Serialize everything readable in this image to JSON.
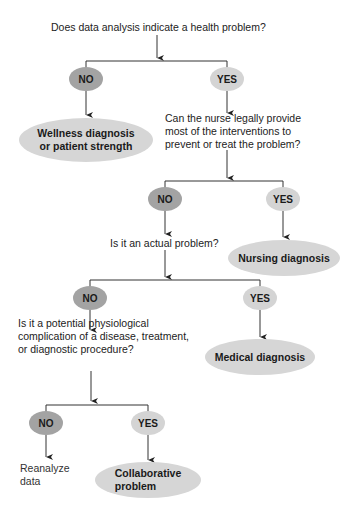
{
  "diagram": {
    "type": "decision-flowchart",
    "colors": {
      "no_oval": "#a3a3a3",
      "yes_oval": "#d4d4d4",
      "outcome_oval": "#d6d6d6",
      "line": "#333333"
    },
    "questions": {
      "q1": "Does data analysis indicate a health problem?",
      "q2": [
        "Can the nurse legally provide",
        "most of the interventions to",
        "prevent or treat the problem?"
      ],
      "q3": "Is it an actual problem?",
      "q4": [
        "Is it a potential physiological",
        "complication of a disease, treatment,",
        "or diagnostic procedure?"
      ]
    },
    "answers": {
      "no": "NO",
      "yes": "YES"
    },
    "outcomes": {
      "wellness": [
        "Wellness diagnosis",
        "or patient strength"
      ],
      "nursing": "Nursing diagnosis",
      "medical": "Medical diagnosis",
      "collaborative": [
        "Collaborative",
        "problem"
      ],
      "reanalyze": [
        "Reanalyze",
        "data"
      ]
    }
  }
}
